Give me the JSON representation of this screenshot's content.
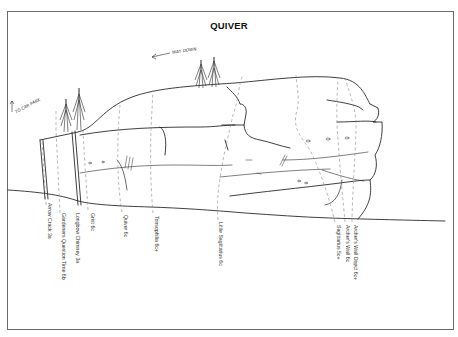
{
  "title": "QUIVER",
  "annotations": {
    "way_down": "WAY DOWN",
    "to_car_park": "TO CAR PARK"
  },
  "routes": [
    {
      "name": "Arrow Crack 3a",
      "x": 48,
      "y": 203
    },
    {
      "name": "Gardeners Question Time 6b",
      "x": 62,
      "y": 213
    },
    {
      "name": "Longbow Chimney 3a",
      "x": 76,
      "y": 213
    },
    {
      "name": "Grist 6c",
      "x": 91,
      "y": 213
    },
    {
      "name": "Quiver 6c",
      "x": 124,
      "y": 215
    },
    {
      "name": "Tonsophilia 6c+",
      "x": 155,
      "y": 216
    },
    {
      "name": "Little Sagittarius 6c",
      "x": 219,
      "y": 222
    },
    {
      "name": "Sagittarius 5c+",
      "x": 337,
      "y": 225
    },
    {
      "name": "Archer's Wall 6c",
      "x": 346,
      "y": 225
    },
    {
      "name": "Archer's Wall Direct 6c+",
      "x": 354,
      "y": 225
    }
  ],
  "colors": {
    "ink": "#2a2a2a",
    "route_line": "#8a8a8a",
    "frame": "#6a6a6a",
    "background": "#ffffff"
  }
}
